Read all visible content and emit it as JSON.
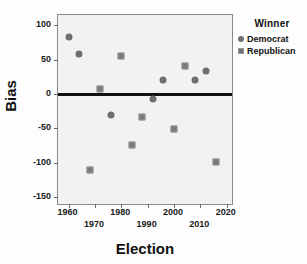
{
  "chart_data": {
    "type": "scatter",
    "title": "",
    "xlabel": "Election",
    "ylabel": "Bias",
    "xlim": [
      1956,
      2022
    ],
    "ylim": [
      -160,
      115
    ],
    "grid": false,
    "legend_position": "right",
    "legend_title": "Winner",
    "xticks": [
      1960,
      1970,
      1980,
      1990,
      2000,
      2010,
      2020
    ],
    "xtick_labels": [
      "1960",
      "1970",
      "1980",
      "1990",
      "2000",
      "2010",
      "2020"
    ],
    "yticks": [
      100,
      50,
      0,
      -50,
      -100,
      -150
    ],
    "ytick_labels": [
      "100",
      "50",
      "0",
      "-50",
      "-100",
      "-150"
    ],
    "reference_line": {
      "y": 0,
      "color": "#111111"
    },
    "series": [
      {
        "name": "Democrat",
        "marker": "circle",
        "color": "#6e6e6e",
        "points": [
          {
            "x": 1960,
            "y": 83
          },
          {
            "x": 1964,
            "y": 58
          },
          {
            "x": 1976,
            "y": -30
          },
          {
            "x": 1992,
            "y": -7
          },
          {
            "x": 1996,
            "y": 21
          },
          {
            "x": 2008,
            "y": 21
          },
          {
            "x": 2012,
            "y": 33
          }
        ]
      },
      {
        "name": "Republican",
        "marker": "square",
        "color": "#7a7a7a",
        "points": [
          {
            "x": 1968,
            "y": -110
          },
          {
            "x": 1972,
            "y": 8
          },
          {
            "x": 1980,
            "y": 56
          },
          {
            "x": 1984,
            "y": -74
          },
          {
            "x": 1988,
            "y": -33
          },
          {
            "x": 2000,
            "y": -51
          },
          {
            "x": 2004,
            "y": 41
          },
          {
            "x": 2016,
            "y": -99
          }
        ]
      }
    ]
  }
}
